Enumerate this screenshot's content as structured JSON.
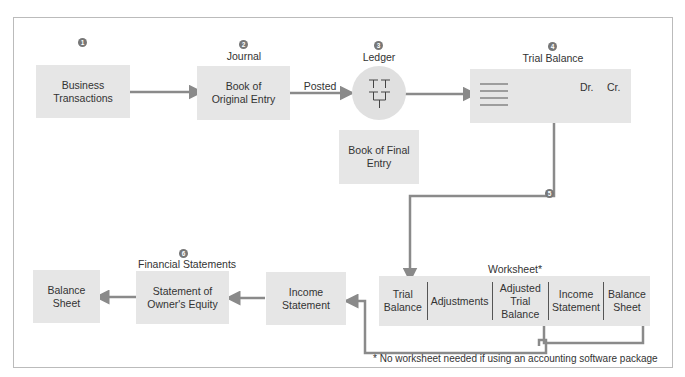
{
  "diagram": {
    "steps": [
      {
        "number": "1",
        "title": "",
        "box_text": "Business\nTransactions"
      },
      {
        "number": "2",
        "title": "Journal",
        "box_text": "Book of\nOriginal Entry"
      },
      {
        "number": "3",
        "title": "Ledger",
        "box_text": "Book of Final\nEntry"
      },
      {
        "number": "4",
        "title": "Trial Balance",
        "dr_label": "Dr.",
        "cr_label": "Cr."
      },
      {
        "number": "5",
        "title": "Worksheet*"
      },
      {
        "number": "6",
        "title": "Financial Statements"
      }
    ],
    "posted_label": "Posted",
    "worksheet_columns": [
      "Trial\nBalance",
      "Adjustments",
      "Adjusted\nTrial\nBalance",
      "Income\nStatement",
      "Balance\nSheet"
    ],
    "financial_statements": {
      "income_statement": "Income\nStatement",
      "owners_equity": "Statement of\nOwner's Equity",
      "balance_sheet": "Balance\nSheet"
    },
    "footnote": "* No worksheet needed if using an accounting software package",
    "colors": {
      "box_fill": "#e6e6e6",
      "arrow": "#8a8a8a",
      "badge": "#777777",
      "border": "#bbbbbb"
    }
  }
}
